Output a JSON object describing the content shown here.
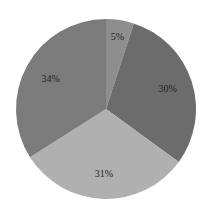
{
  "chart_data": {
    "type": "pie",
    "title": "",
    "categories": [
      "A",
      "B",
      "C",
      "D"
    ],
    "values": [
      5,
      30,
      31,
      34
    ],
    "labels": [
      "5%",
      "30%",
      "31%",
      "34%"
    ],
    "colors": [
      "#8e8e8e",
      "#6c6c6c",
      "#b0b0b0",
      "#7b7b7b"
    ],
    "start_angle_deg": 0,
    "direction": "clockwise",
    "legend": "none"
  },
  "layout": {
    "cx": 106,
    "cy": 109,
    "r": 90,
    "label_radius": [
      0.82,
      0.72,
      0.72,
      0.7
    ]
  }
}
